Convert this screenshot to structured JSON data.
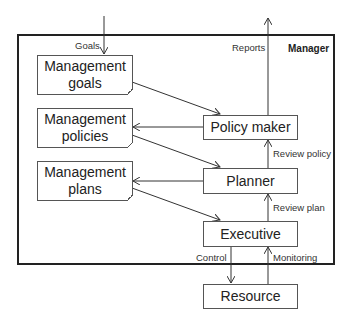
{
  "frame": {
    "label": "Manager"
  },
  "documents": [
    {
      "id": "goals",
      "label": "Management goals"
    },
    {
      "id": "policies",
      "label": "Management policies"
    },
    {
      "id": "plans",
      "label": "Management plans"
    }
  ],
  "processes": [
    {
      "id": "policy_maker",
      "label": "Policy maker"
    },
    {
      "id": "planner",
      "label": "Planner"
    },
    {
      "id": "executive",
      "label": "Executive"
    },
    {
      "id": "resource",
      "label": "Resource"
    }
  ],
  "edge_labels": {
    "goals": "Goals",
    "reports": "Reports",
    "review_policy": "Review policy",
    "review_plan": "Review plan",
    "control": "Control",
    "monitoring": "Monitoring"
  }
}
